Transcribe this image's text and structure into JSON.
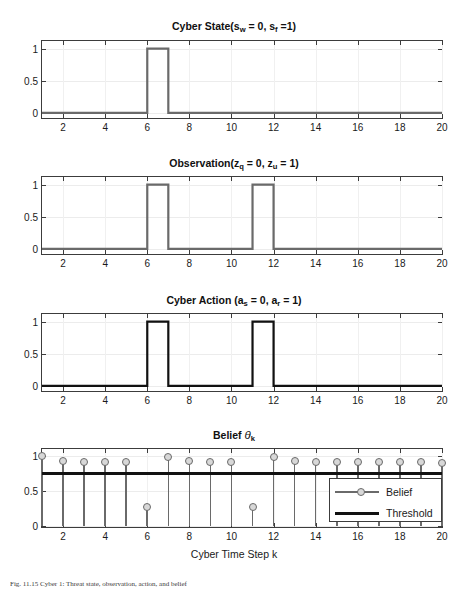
{
  "figure": {
    "xlabel": "Cyber Time Step k",
    "caption": "Fig. 11.15  Cyber 1: Threat state, observation, action, and belief"
  },
  "chart_data": [
    {
      "type": "line",
      "panel_index": 0,
      "title_parts": {
        "main": "Cyber State(s",
        "sub1": "w",
        "mid": " = 0, s",
        "sub2": "f",
        "end": " =1)"
      },
      "title": "Cyber State(s_w = 0, s_f =1)",
      "xlabel": "",
      "ylabel": "",
      "xlim": [
        1,
        20
      ],
      "ylim": [
        -0.08,
        1.12
      ],
      "yticks": [
        0,
        0.5,
        1
      ],
      "ytick_labels": [
        "0",
        "0.5",
        "1"
      ],
      "xticks": [
        2,
        4,
        6,
        8,
        10,
        12,
        14,
        16,
        18,
        20
      ],
      "xtick_labels": [
        "2",
        "4",
        "6",
        "8",
        "10",
        "12",
        "14",
        "16",
        "18",
        "20"
      ],
      "grid": true,
      "color": "#6a6a6a",
      "style": "stairs",
      "x": [
        1,
        2,
        3,
        4,
        5,
        6,
        7,
        8,
        9,
        10,
        11,
        12,
        13,
        14,
        15,
        16,
        17,
        18,
        19,
        20
      ],
      "values": [
        0,
        0,
        0,
        0,
        0,
        1,
        0,
        0,
        0,
        0,
        0,
        0,
        0,
        0,
        0,
        0,
        0,
        0,
        0,
        0
      ]
    },
    {
      "type": "line",
      "panel_index": 1,
      "title_parts": {
        "main": "Observation(z",
        "sub1": "q",
        "mid": " = 0, z",
        "sub2": "u",
        "end": " = 1)"
      },
      "title": "Observation(z_q = 0, z_u = 1)",
      "xlabel": "",
      "ylabel": "",
      "xlim": [
        1,
        20
      ],
      "ylim": [
        -0.08,
        1.12
      ],
      "yticks": [
        0,
        0.5,
        1
      ],
      "ytick_labels": [
        "0",
        "0.5",
        "1"
      ],
      "xticks": [
        2,
        4,
        6,
        8,
        10,
        12,
        14,
        16,
        18,
        20
      ],
      "xtick_labels": [
        "2",
        "4",
        "6",
        "8",
        "10",
        "12",
        "14",
        "16",
        "18",
        "20"
      ],
      "grid": true,
      "color": "#6a6a6a",
      "style": "stairs",
      "x": [
        1,
        2,
        3,
        4,
        5,
        6,
        7,
        8,
        9,
        10,
        11,
        12,
        13,
        14,
        15,
        16,
        17,
        18,
        19,
        20
      ],
      "values": [
        0,
        0,
        0,
        0,
        0,
        1,
        0,
        0,
        0,
        0,
        1,
        0,
        0,
        0,
        0,
        0,
        0,
        0,
        0,
        0
      ]
    },
    {
      "type": "line",
      "panel_index": 2,
      "title_parts": {
        "main": "Cyber Action (a",
        "sub1": "s",
        "mid": " = 0, a",
        "sub2": "r",
        "end": " = 1)"
      },
      "title": "Cyber Action (a_s = 0, a_r = 1)",
      "xlabel": "",
      "ylabel": "",
      "xlim": [
        1,
        20
      ],
      "ylim": [
        -0.08,
        1.12
      ],
      "yticks": [
        0,
        0.5,
        1
      ],
      "ytick_labels": [
        "0",
        "0.5",
        "1"
      ],
      "xticks": [
        2,
        4,
        6,
        8,
        10,
        12,
        14,
        16,
        18,
        20
      ],
      "xtick_labels": [
        "2",
        "4",
        "6",
        "8",
        "10",
        "12",
        "14",
        "16",
        "18",
        "20"
      ],
      "grid": true,
      "color": "#111111",
      "style": "stairs",
      "x": [
        1,
        2,
        3,
        4,
        5,
        6,
        7,
        8,
        9,
        10,
        11,
        12,
        13,
        14,
        15,
        16,
        17,
        18,
        19,
        20
      ],
      "values": [
        0,
        0,
        0,
        0,
        0,
        1,
        0,
        0,
        0,
        0,
        1,
        0,
        0,
        0,
        0,
        0,
        0,
        0,
        0,
        0
      ]
    },
    {
      "type": "line",
      "panel_index": 3,
      "title_parts": {
        "main": "Belief ",
        "italic": "θ",
        "sub1": "k",
        "mid": "",
        "sub2": "",
        "end": ""
      },
      "title": "Belief θ_k",
      "xlabel": "Cyber Time Step k",
      "ylabel": "",
      "xlim": [
        1,
        20
      ],
      "ylim": [
        -0.02,
        1.1
      ],
      "yticks": [
        0,
        0.5,
        1
      ],
      "ytick_labels": [
        "0",
        "0.5",
        "1"
      ],
      "xticks": [
        2,
        4,
        6,
        8,
        10,
        12,
        14,
        16,
        18,
        20
      ],
      "xtick_labels": [
        "2",
        "4",
        "6",
        "8",
        "10",
        "12",
        "14",
        "16",
        "18",
        "20"
      ],
      "grid": true,
      "style": "stem",
      "marker_color": "#6a6a6a",
      "threshold_color": "#111111",
      "threshold": 0.75,
      "x": [
        1,
        2,
        3,
        4,
        5,
        6,
        7,
        8,
        9,
        10,
        11,
        12,
        13,
        14,
        15,
        16,
        17,
        18,
        19,
        20
      ],
      "values": [
        1.0,
        0.93,
        0.92,
        0.91,
        0.91,
        0.27,
        0.99,
        0.93,
        0.92,
        0.91,
        0.27,
        0.99,
        0.93,
        0.92,
        0.91,
        0.91,
        0.91,
        0.91,
        0.91,
        0.9
      ],
      "legend": {
        "position": "lower-right",
        "entries": [
          {
            "label": "Belief",
            "style": "line-marker"
          },
          {
            "label": "Threshold",
            "style": "line"
          }
        ]
      }
    }
  ]
}
